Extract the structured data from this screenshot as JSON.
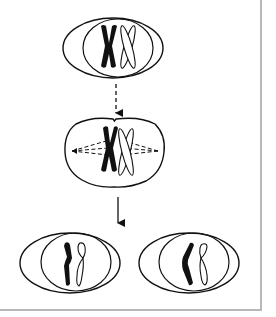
{
  "diagram": {
    "type": "cell-division",
    "stages": [
      {
        "id": "parent-cell",
        "description": "cell with nucleus containing pair of homologous chromosomes (one dark, one light), each duplicated"
      },
      {
        "id": "metaphase-cell",
        "description": "chromosome pair aligned on spindle fibers"
      },
      {
        "id": "daughter-cell-left",
        "description": "daughter cell with one dark and one light chromatid"
      },
      {
        "id": "daughter-cell-right",
        "description": "daughter cell with one dark and one light chromatid"
      }
    ],
    "arrows": [
      {
        "from": "parent-cell",
        "to": "metaphase-cell",
        "style": "dashed"
      },
      {
        "from": "metaphase-cell",
        "to": "daughter-cells",
        "style": "solid"
      }
    ],
    "colors": {
      "stroke": "#111111",
      "dark_chromosome": "#111111",
      "light_chromosome": "#ffffff",
      "frame_border": "#b8b8b8",
      "background": "#ffffff"
    }
  }
}
